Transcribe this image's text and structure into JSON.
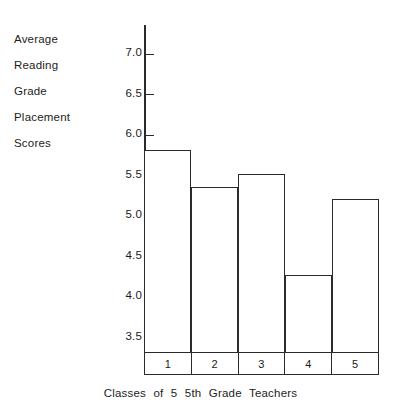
{
  "chart_data": {
    "type": "bar",
    "title": "",
    "categories": [
      "1",
      "2",
      "3",
      "4",
      "5"
    ],
    "values": [
      5.8,
      5.35,
      5.5,
      4.25,
      5.2
    ],
    "series": [
      {
        "name": "Average Reading Grade Placement Scores",
        "values": [
          5.8,
          5.35,
          5.5,
          4.25,
          5.2
        ]
      }
    ],
    "xlabel": "Classes of 5 5th Grade Teachers",
    "ylabel": "Average Reading Grade Placement Scores",
    "ylim": [
      3.3,
      7.35
    ],
    "yticks": [
      3.5,
      4.0,
      4.5,
      5.0,
      5.5,
      6.0,
      6.5,
      7.0
    ],
    "ytick_labels": [
      "3.5",
      "4.0",
      "4.5",
      "5.0",
      "5.5",
      "6.0",
      "6.5",
      "7.0"
    ],
    "grid": false,
    "legend": false,
    "bar_style": "outline",
    "colors": {
      "bar_edge": "#2b2b2b",
      "bar_fill": "#ffffff",
      "axis": "#2b2b2b",
      "text": "#1d1d1d",
      "background": "#ffffff"
    }
  },
  "y_caption_lines": [
    {
      "text": "Average"
    },
    {
      "text": "Reading"
    },
    {
      "text": "Grade"
    },
    {
      "text": "Placement"
    },
    {
      "text": "Scores"
    }
  ],
  "x_caption": "Classes of 5 5th Grade Teachers"
}
